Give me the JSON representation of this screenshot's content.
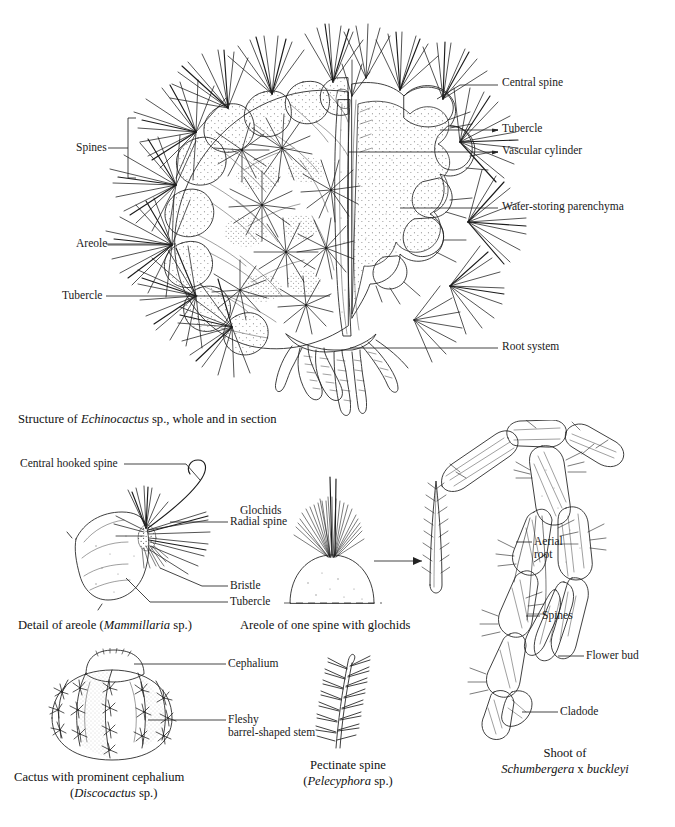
{
  "page": {
    "background": "#ffffff",
    "ink_color": "#1d1d1d",
    "kind": "botanical-plate"
  },
  "main_figure": {
    "name": "echinocactus-figure",
    "caption_parts": {
      "before": "Structure of ",
      "italic": "Echinocactus",
      "after": " sp., whole and in section"
    },
    "caption_full": "Structure of Echinocactus sp., whole and in section",
    "labels_left": [
      {
        "id": "spines",
        "text": "Spines",
        "has_bracket": true
      },
      {
        "id": "areole",
        "text": "Areole",
        "has_bracket": false
      },
      {
        "id": "tubercle",
        "text": "Tubercle",
        "has_bracket": false
      }
    ],
    "labels_right": [
      {
        "id": "central-spine",
        "text": "Central spine"
      },
      {
        "id": "tubercle-right",
        "text": "Tubercle"
      },
      {
        "id": "vascular-cylinder",
        "text": "Vascular cylinder"
      },
      {
        "id": "water-storing-parenchyma",
        "text": "Water-storing parenchyma"
      },
      {
        "id": "root-system",
        "text": "Root system"
      }
    ]
  },
  "panel_mammillaria": {
    "name": "mammillaria-areole-detail",
    "labels": [
      {
        "id": "central-hooked-spine",
        "text": "Central hooked spine"
      },
      {
        "id": "radial-spine",
        "text": "Radial spine"
      },
      {
        "id": "bristle",
        "text": "Bristle"
      },
      {
        "id": "tubercle",
        "text": "Tubercle"
      }
    ],
    "caption_parts": {
      "before": "Detail of areole (",
      "italic": "Mammillaria",
      "after": " sp.)"
    },
    "caption_full": "Detail of areole (Mammillaria sp.)"
  },
  "panel_glochids": {
    "name": "glochid-areole-detail",
    "labels": [
      {
        "id": "glochids",
        "text": "Glochids"
      }
    ],
    "caption_full": "Areole of one spine with glochids"
  },
  "panel_discocactus": {
    "name": "discocactus-figure",
    "labels": [
      {
        "id": "cephalium",
        "text": "Cephalium"
      },
      {
        "id": "fleshy-stem-line1",
        "text": "Fleshy"
      },
      {
        "id": "fleshy-stem-line2",
        "text": "barrel-shaped stem"
      }
    ],
    "caption_line1": "Cactus with prominent cephalium",
    "caption_line2_parts": {
      "before": "(",
      "italic": "Discocactus",
      "after": " sp.)"
    },
    "caption_line2_full": "(Discocactus sp.)"
  },
  "panel_pectinate": {
    "name": "pectinate-spine-figure",
    "caption_line1": "Pectinate spine",
    "caption_line2_parts": {
      "before": "(",
      "italic": "Pelecyphora",
      "after": " sp.)"
    },
    "caption_line2_full": "(Pelecyphora sp.)"
  },
  "panel_schlumbergera": {
    "name": "schlumbergera-shoot-figure",
    "labels": [
      {
        "id": "aerial-root-line1",
        "text": "Aerial"
      },
      {
        "id": "aerial-root-line2",
        "text": "root"
      },
      {
        "id": "spines",
        "text": "Spines"
      },
      {
        "id": "flower-bud",
        "text": "Flower bud"
      },
      {
        "id": "cladode",
        "text": "Cladode"
      }
    ],
    "caption_line1": "Shoot of",
    "caption_line2_parts": {
      "italic_a": "Schumbergera",
      "mid": " x ",
      "italic_b": "buckleyi"
    },
    "caption_line2_full": "Schumbergera x buckleyi"
  }
}
